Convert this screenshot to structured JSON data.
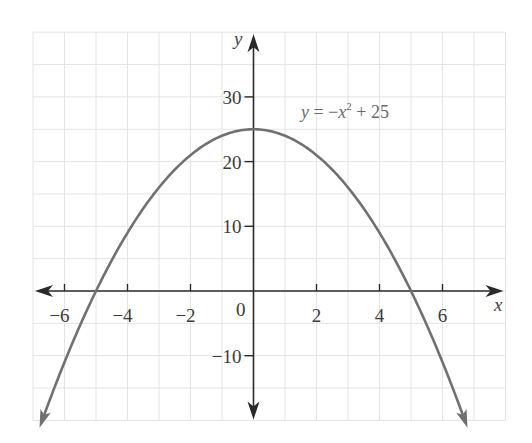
{
  "chart_data": {
    "type": "line",
    "title": "",
    "function": "y = -x^2 + 25",
    "annotation": {
      "text_y": "y",
      "text_eq": " = −",
      "text_x": "x",
      "text_sup": "2",
      "text_rest": " + 25",
      "x": 5,
      "y": 28
    },
    "xlabel": "x",
    "ylabel": "y",
    "xlim": [
      -7,
      8
    ],
    "ylim": [
      -20,
      40
    ],
    "x_ticks": [
      -6,
      -4,
      -2,
      2,
      4,
      6
    ],
    "x_tick_labels": [
      "−6",
      "−4",
      "−2",
      "2",
      "4",
      "6"
    ],
    "y_ticks": [
      30,
      20,
      10,
      -10
    ],
    "y_tick_labels": [
      "30",
      "20",
      "10",
      "−10"
    ],
    "origin_label": "0",
    "grid": true,
    "grid_x_step": 1,
    "grid_y_step": 5,
    "curve_x_range": [
      -6.7,
      6.7
    ],
    "series": [
      {
        "name": "y = -x^2 + 25",
        "x": [
          -6.7,
          -6,
          -5,
          -4,
          -3,
          -2,
          -1,
          0,
          1,
          2,
          3,
          4,
          5,
          6,
          6.7
        ],
        "y": [
          -19.89,
          -11,
          0,
          9,
          16,
          21,
          24,
          25,
          24,
          21,
          16,
          9,
          0,
          -11,
          -19.89
        ]
      }
    ],
    "colors": {
      "curve": "#707070",
      "axis": "#2a2a2a",
      "grid": "#e4e4e4"
    }
  }
}
